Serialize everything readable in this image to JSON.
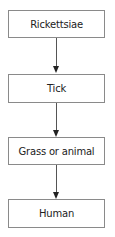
{
  "diagram": {
    "type": "vertical-flowchart",
    "nodes": [
      {
        "id": "n1",
        "label": "Rickettsiae"
      },
      {
        "id": "n2",
        "label": "Tick"
      },
      {
        "id": "n3",
        "label": "Grass or animal"
      },
      {
        "id": "n4",
        "label": "Human"
      }
    ],
    "edges": [
      {
        "from": "Rickettsiae",
        "to": "Tick"
      },
      {
        "from": "Tick",
        "to": "Grass or animal"
      },
      {
        "from": "Grass or animal",
        "to": "Human"
      }
    ]
  }
}
